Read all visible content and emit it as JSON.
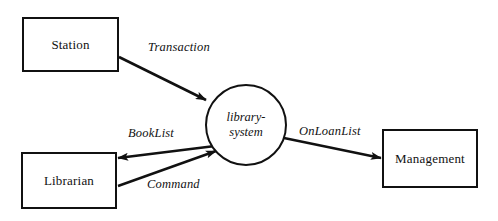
{
  "diagram": {
    "type": "data-flow-diagram",
    "background_color": "#ffffff",
    "stroke_color": "#111111",
    "nodes": [
      {
        "id": "station",
        "shape": "rectangle",
        "label": "Station",
        "x": 22,
        "y": 17,
        "width": 97,
        "height": 55
      },
      {
        "id": "librarian",
        "shape": "rectangle",
        "label": "Librarian",
        "x": 21,
        "y": 152,
        "width": 96,
        "height": 57
      },
      {
        "id": "management",
        "shape": "rectangle",
        "label": "Management",
        "x": 382,
        "y": 129,
        "width": 96,
        "height": 59
      },
      {
        "id": "library-system",
        "shape": "circle",
        "label_line1": "library-",
        "label_line2": "system",
        "center_x": 246,
        "center_y": 125,
        "radius": 41
      }
    ],
    "flows": [
      {
        "id": "transaction",
        "label": "Transaction",
        "from": "station",
        "to": "library-system",
        "label_x": 148,
        "label_y": 40,
        "from_x": 119,
        "from_y": 57,
        "to_x": 206,
        "to_y": 100
      },
      {
        "id": "booklist",
        "label": "BookList",
        "from": "library-system",
        "to": "librarian",
        "label_x": 128,
        "label_y": 126,
        "from_x": 214,
        "from_y": 146,
        "to_x": 118,
        "to_y": 158
      },
      {
        "id": "command",
        "label": "Command",
        "from": "librarian",
        "to": "library-system",
        "label_x": 147,
        "label_y": 177,
        "from_x": 118,
        "from_y": 186,
        "to_x": 216,
        "to_y": 151
      },
      {
        "id": "onloanlist",
        "label": "OnLoanList",
        "from": "library-system",
        "to": "management",
        "label_x": 299,
        "label_y": 124,
        "from_x": 284,
        "from_y": 138,
        "to_x": 381,
        "to_y": 158
      }
    ]
  }
}
